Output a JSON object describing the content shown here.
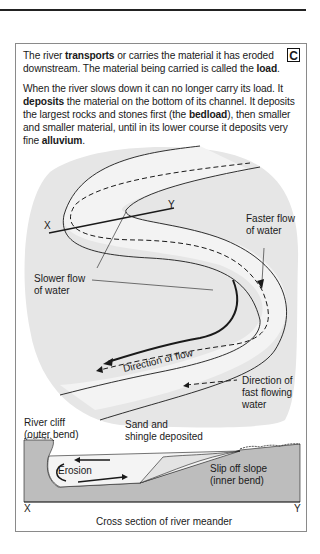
{
  "section_badge": "C",
  "paragraphs": [
    {
      "parts": [
        {
          "text": "The river ",
          "bold": false
        },
        {
          "text": "transports",
          "bold": true
        },
        {
          "text": " or carries the material it has eroded downstream. The material being carried is called the ",
          "bold": false
        },
        {
          "text": "load",
          "bold": true
        },
        {
          "text": ".",
          "bold": false
        }
      ]
    },
    {
      "parts": [
        {
          "text": "When the river slows down it can no longer carry its load. It ",
          "bold": false
        },
        {
          "text": "deposits",
          "bold": true
        },
        {
          "text": " the material on the bottom of its channel. It deposits the largest rocks and stones first (the ",
          "bold": false
        },
        {
          "text": "bedload",
          "bold": true
        },
        {
          "text": "), then smaller and smaller material, until in its lower course it deposits very fine ",
          "bold": false
        },
        {
          "text": "alluvium",
          "bold": true
        },
        {
          "text": ".",
          "bold": false
        }
      ]
    }
  ],
  "map_diagram": {
    "label_x": "X",
    "label_y": "Y",
    "faster_flow_line1": "Faster flow",
    "faster_flow_line2": "of water",
    "slower_flow_line1": "Slower flow",
    "slower_flow_line2": "of water",
    "direction_of_flow": "Direction of flow",
    "legend_line1": "Direction of",
    "legend_line2": "fast flowing",
    "legend_line3": "water"
  },
  "cross_section": {
    "river_cliff_line1": "River cliff",
    "river_cliff_line2": "(outer bend)",
    "sand_line1": "Sand and",
    "sand_line2": "shingle deposited",
    "erosion": "Erosion",
    "slip_line1": "Slip off slope",
    "slip_line2": "(inner bend)",
    "label_x": "X",
    "label_y": "Y",
    "caption": "Cross section of river meander"
  },
  "colors": {
    "land_fill": "#e6e6e6",
    "bank_fill": "#bdbdbd",
    "water_fill": "#f4f4f4",
    "line": "#1a1a1a"
  }
}
